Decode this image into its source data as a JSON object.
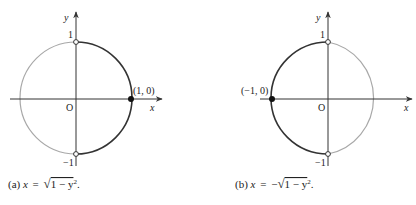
{
  "figure": {
    "panels": [
      {
        "id": "a",
        "caption_prefix": "(a)",
        "caption_lhs": "x",
        "caption_eq": "=",
        "caption_sign": "",
        "caption_radicand": "1 − y",
        "caption_exp": "2",
        "caption_end": ".",
        "axis_x_label": "x",
        "axis_y_label": "y",
        "origin_label": "O",
        "tick_top": "1",
        "tick_bottom": "−1",
        "point_label": "(1, 0)",
        "highlighted_half": "right",
        "endpoints": [
          "(0, 1) open",
          "(0, −1) open"
        ],
        "filled_point": "(1, 0)"
      },
      {
        "id": "b",
        "caption_prefix": "(b)",
        "caption_lhs": "x",
        "caption_eq": "=",
        "caption_sign": "−",
        "caption_radicand": "1 − y",
        "caption_exp": "2",
        "caption_end": ".",
        "axis_x_label": "x",
        "axis_y_label": "y",
        "origin_label": "O",
        "tick_top": "1",
        "tick_bottom": "−1",
        "point_label": "(−1, 0)",
        "highlighted_half": "left",
        "endpoints": [
          "(0, 1) open",
          "(0, −1) open"
        ],
        "filled_point": "(−1, 0)"
      }
    ],
    "colors": {
      "highlight": "#333333",
      "faded": "#a8a8a8",
      "axis": "#333333"
    }
  }
}
